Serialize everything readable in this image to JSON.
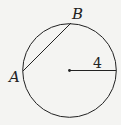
{
  "diagram": {
    "type": "circle-with-chord",
    "points": {
      "A": "A",
      "B": "B"
    },
    "radius_label": "4",
    "colors": {
      "stroke": "#222222",
      "background": "#f4f4f2"
    }
  }
}
